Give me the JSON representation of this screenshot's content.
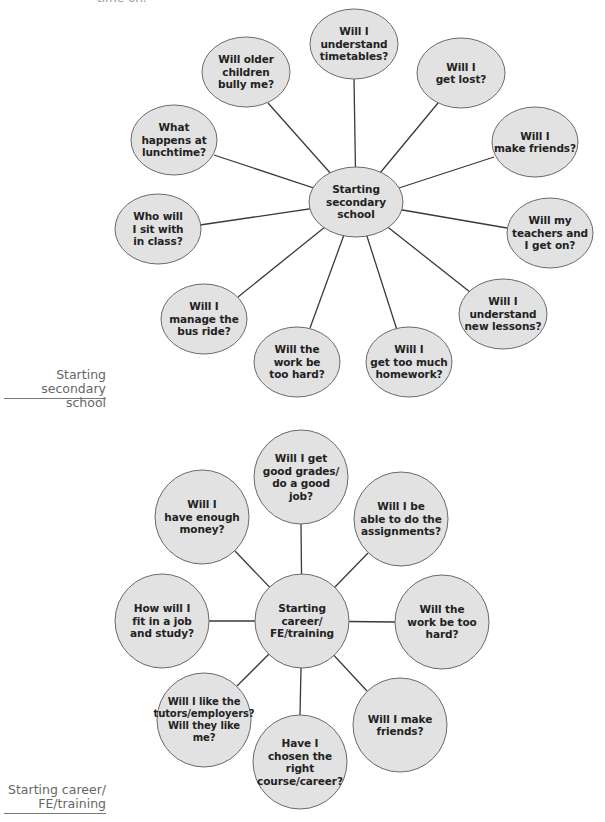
{
  "page": {
    "clipped_top_text": "time on."
  },
  "colors": {
    "bubble_fill": "#e2e2e2",
    "bubble_stroke": "#6a6a6a",
    "connector": "#3a3a3a",
    "side_label": "#666666",
    "text": "#222222"
  },
  "diagrams": [
    {
      "side_label": "Starting\nsecondary school",
      "center": {
        "label": "Starting\nsecondary\nschool"
      },
      "questions": [
        {
          "label": "Will I\nunderstand\ntimetables?"
        },
        {
          "label": "Will older\nchildren\nbully me?"
        },
        {
          "label": "Will I\nget lost?"
        },
        {
          "label": "What\nhappens at\nlunchtime?"
        },
        {
          "label": "Will I\nmake friends?"
        },
        {
          "label": "Who will\nI sit with\nin class?"
        },
        {
          "label": "Will my\nteachers and\nI get on?"
        },
        {
          "label": "Will I\nmanage the\nbus ride?"
        },
        {
          "label": "Will I\nunderstand\nnew lessons?"
        },
        {
          "label": "Will the\nwork be\ntoo hard?"
        },
        {
          "label": "Will I\nget too much\nhomework?"
        }
      ]
    },
    {
      "side_label": "Starting career/\nFE/training",
      "center": {
        "label": "Starting\ncareer/\nFE/training"
      },
      "questions": [
        {
          "label": "Will I get\ngood grades/\ndo a good\njob?"
        },
        {
          "label": "Will I\nhave enough\nmoney?"
        },
        {
          "label": "Will I be\nable to do the\nassignments?"
        },
        {
          "label": "How will I\nfit in a job\nand study?"
        },
        {
          "label": "Will the\nwork be too\nhard?"
        },
        {
          "label": "Will I like the\ntutors/employers?\nWill they like\nme?"
        },
        {
          "label": "Have I\nchosen the right\ncourse/career?"
        },
        {
          "label": "Will I make\nfriends?"
        }
      ]
    }
  ]
}
